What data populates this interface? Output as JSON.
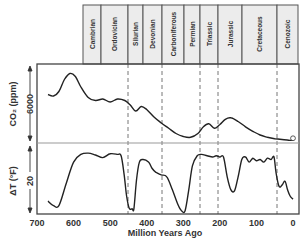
{
  "chart_data": {
    "type": "line",
    "title": "",
    "xlabel": "Million Years Ago",
    "xlim": [
      700,
      0
    ],
    "xticks": [
      700,
      600,
      500,
      400,
      300,
      200,
      100,
      0
    ],
    "periods": [
      {
        "name": "Cambrian",
        "start": 541,
        "end": 488
      },
      {
        "name": "Ordovician",
        "start": 488,
        "end": 443
      },
      {
        "name": "Silurian",
        "start": 443,
        "end": 416
      },
      {
        "name": "Devonian",
        "start": 416,
        "end": 359
      },
      {
        "name": "Carboniferous",
        "start": 359,
        "end": 299
      },
      {
        "name": "Permian",
        "start": 299,
        "end": 251
      },
      {
        "name": "Triassic",
        "start": 251,
        "end": 200
      },
      {
        "name": "Jurassic",
        "start": 200,
        "end": 146
      },
      {
        "name": "Cretaceous",
        "start": 146,
        "end": 65
      },
      {
        "name": "Cenozoic",
        "start": 65,
        "end": 0
      }
    ],
    "dashed_lines_mya": [
      443,
      359,
      251,
      200,
      47
    ],
    "panels": [
      {
        "name": "CO2",
        "ylabel": "CO₂ (ppm)",
        "ytick_label": "6000",
        "series": [
          {
            "name": "CO2 (ppm)",
            "x": [
              670,
              655,
              640,
              625,
              610,
              595,
              580,
              560,
              540,
              520,
              500,
              480,
              460,
              445,
              430,
              415,
              400,
              380,
              360,
              340,
              320,
              300,
              280,
              260,
              245,
              230,
              215,
              200,
              185,
              170,
              150,
              130,
              110,
              90,
              70,
              50,
              30,
              10,
              0
            ],
            "y_rel": [
              0.62,
              0.6,
              0.66,
              0.82,
              0.9,
              0.86,
              0.72,
              0.58,
              0.54,
              0.56,
              0.52,
              0.56,
              0.54,
              0.48,
              0.4,
              0.46,
              0.42,
              0.32,
              0.24,
              0.17,
              0.1,
              0.06,
              0.05,
              0.1,
              0.19,
              0.23,
              0.17,
              0.22,
              0.29,
              0.31,
              0.26,
              0.19,
              0.13,
              0.08,
              0.05,
              0.03,
              0.02,
              0.01,
              0.01
            ]
          }
        ]
      },
      {
        "name": "Temperature",
        "ylabel": "ΔT (°F)",
        "ytick_label": "20",
        "series": [
          {
            "name": "ΔT (°F)",
            "x": [
              670,
              655,
              640,
              620,
              600,
              580,
              560,
              540,
              520,
              500,
              480,
              470,
              462,
              455,
              448,
              440,
              435,
              428,
              420,
              410,
              395,
              385,
              375,
              360,
              345,
              330,
              315,
              305,
              295,
              285,
              275,
              262,
              250,
              235,
              220,
              210,
              200,
              190,
              180,
              170,
              160,
              150,
              140,
              130,
              120,
              110,
              100,
              90,
              80,
              70,
              60,
              52,
              46,
              38,
              30,
              22,
              15,
              8,
              0
            ],
            "y_rel": [
              0.17,
              0.1,
              0.1,
              0.45,
              0.78,
              0.9,
              0.92,
              0.89,
              0.85,
              0.91,
              0.9,
              0.88,
              0.6,
              0.25,
              0.06,
              0.05,
              0.05,
              0.5,
              0.78,
              0.82,
              0.78,
              0.68,
              0.62,
              0.58,
              0.55,
              0.35,
              0.12,
              0.02,
              0.02,
              0.35,
              0.72,
              0.88,
              0.9,
              0.88,
              0.86,
              0.88,
              0.86,
              0.86,
              0.55,
              0.35,
              0.33,
              0.55,
              0.82,
              0.86,
              0.78,
              0.84,
              0.8,
              0.82,
              0.78,
              0.84,
              0.82,
              0.86,
              0.6,
              0.4,
              0.42,
              0.48,
              0.35,
              0.25,
              0.2
            ]
          }
        ]
      }
    ]
  }
}
